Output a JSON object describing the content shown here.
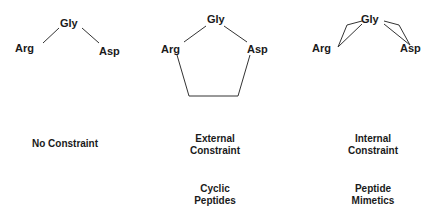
{
  "panels": [
    {
      "nodes": {
        "top": "Gly",
        "left": "Arg",
        "right": "Asp"
      },
      "caption": [
        "No Constraint"
      ],
      "subcaption": []
    },
    {
      "nodes": {
        "top": "Gly",
        "left": "Arg",
        "right": "Asp"
      },
      "caption": [
        "External",
        "Constraint"
      ],
      "subcaption": [
        "Cyclic",
        "Peptides"
      ]
    },
    {
      "nodes": {
        "top": "Gly",
        "left": "Arg",
        "right": "Asp"
      },
      "caption": [
        "Internal",
        "Constraint"
      ],
      "subcaption": [
        "Peptide",
        "Mimetics"
      ]
    }
  ],
  "colors": {
    "line": "#333333",
    "text": "#1a1a1a",
    "background": "#ffffff"
  }
}
